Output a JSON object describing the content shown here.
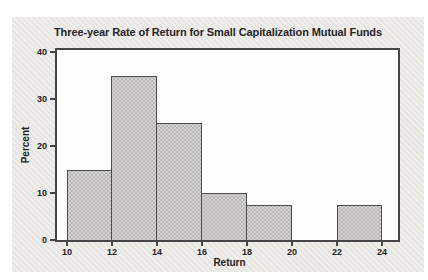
{
  "chart_data": {
    "type": "bar",
    "subtype": "histogram",
    "title": "Three-year Rate of Return for Small Capitalization Mutual Funds",
    "xlabel": "Return",
    "ylabel": "Percent",
    "bin_edges": [
      10,
      12,
      14,
      16,
      18,
      20,
      22,
      24
    ],
    "values": [
      15,
      35,
      25,
      10,
      7.5,
      0,
      7.5
    ],
    "x_ticks": [
      "10",
      "12",
      "14",
      "16",
      "18",
      "20",
      "22",
      "24"
    ],
    "y_ticks": [
      "0",
      "10",
      "20",
      "30",
      "40"
    ],
    "xlim": [
      9.6,
      24.7
    ],
    "ylim": [
      0,
      40
    ],
    "grid": false,
    "legend_position": null
  },
  "colors": {
    "page_background": "#ffffff",
    "panel_background": "#ebe9e6",
    "plot_background": "#fdfdfb",
    "axis_line": "#454447",
    "bar_fill": "#d4d3d0",
    "bar_dot_texture": "#b8b7b3",
    "bar_border": "#4c4b4c",
    "text": "#232226"
  }
}
